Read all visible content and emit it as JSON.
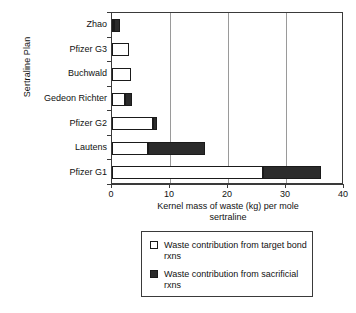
{
  "chart_data": {
    "type": "bar",
    "orientation": "horizontal",
    "stacked": true,
    "title": "",
    "xlabel": "Kernel mass of waste (kg) per mole sertraline",
    "ylabel": "Sertraline Plan",
    "xlim": [
      0,
      40
    ],
    "xticks": [
      0,
      10,
      20,
      30,
      40
    ],
    "xtick_labels": [
      "0",
      "10",
      "20",
      "30",
      "40"
    ],
    "grid": "vertical",
    "legend_position": "below-axes",
    "categories": [
      "Zhao",
      "Pfizer G3",
      "Buchwald",
      "Gedeon Richter",
      "Pfizer G2",
      "Lautens",
      "Pfizer G1"
    ],
    "series": [
      {
        "name": "Waste contribution from target bond rxns",
        "color": "#ffffff",
        "values": [
          0.3,
          2.9,
          3.2,
          2.2,
          7.0,
          6.2,
          26.0
        ]
      },
      {
        "name": "Waste contribution from sacrificial rxns",
        "color": "#2b2b2b",
        "values": [
          1.0,
          0.0,
          0.0,
          1.3,
          0.7,
          9.8,
          10.0
        ]
      }
    ],
    "totals": [
      1.3,
      2.9,
      3.2,
      3.5,
      7.7,
      16.0,
      36.0
    ]
  },
  "axis": {
    "x_title_line1": "Kernel mass of waste (kg) per mole",
    "x_title_line2": "sertraline",
    "y_title": "Sertraline Plan"
  },
  "legend": {
    "entries": [
      {
        "label": "Waste contribution from target bond rxns",
        "swatch": "open-square-icon"
      },
      {
        "label": "Waste contribution from sacrificial rxns",
        "swatch": "filled-square-icon"
      }
    ]
  }
}
